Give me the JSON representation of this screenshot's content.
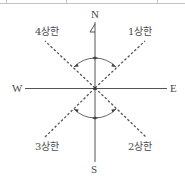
{
  "diagram": {
    "type": "compass-quadrant",
    "directions": {
      "north": "N",
      "south": "S",
      "west": "W",
      "east": "E"
    },
    "quadrants": {
      "q1": "1상한",
      "q2": "2상한",
      "q3": "3상한",
      "q4": "4상한"
    },
    "colors": {
      "line": "#555555",
      "text": "#4a4a4a",
      "border": "#bbbbbb"
    }
  }
}
